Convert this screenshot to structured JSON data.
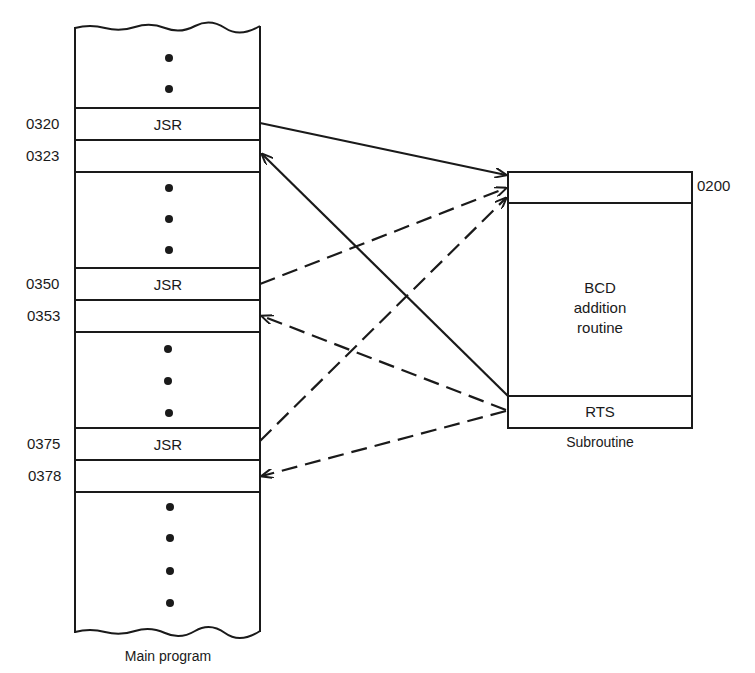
{
  "main_program": {
    "caption": "Main program",
    "rows": [
      {
        "address": "0320",
        "content": "JSR"
      },
      {
        "address": "0323",
        "content": ""
      },
      {
        "address": "0350",
        "content": "JSR"
      },
      {
        "address": "0353",
        "content": ""
      },
      {
        "address": "0375",
        "content": "JSR"
      },
      {
        "address": "0378",
        "content": ""
      }
    ]
  },
  "subroutine": {
    "caption": "Subroutine",
    "entry_address": "0200",
    "body_line1": "BCD",
    "body_line2": "addition",
    "body_line3": "routine",
    "return_instruction": "RTS"
  },
  "arrows": [
    {
      "from": "0320 JSR",
      "to": "0200",
      "style": "solid"
    },
    {
      "from": "RTS",
      "to": "0323",
      "style": "solid"
    },
    {
      "from": "0350 JSR",
      "to": "0200",
      "style": "dashed"
    },
    {
      "from": "RTS",
      "to": "0353",
      "style": "dashed"
    },
    {
      "from": "0375 JSR",
      "to": "0200",
      "style": "dashed"
    },
    {
      "from": "RTS",
      "to": "0378",
      "style": "dashed"
    }
  ]
}
